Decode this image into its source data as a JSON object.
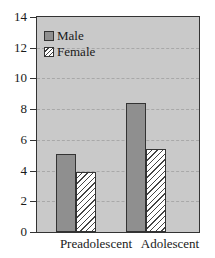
{
  "chart_data": {
    "type": "bar",
    "title": "",
    "xlabel": "",
    "ylabel": "",
    "categories": [
      "Preadolescent",
      "Adolescent"
    ],
    "series": [
      {
        "name": "Male",
        "values": [
          5.1,
          8.4
        ],
        "fill": "#8f8f8f",
        "pattern": "solid"
      },
      {
        "name": "Female",
        "values": [
          3.9,
          5.4
        ],
        "fill": "#ffffff",
        "pattern": "diagonal-hatch"
      }
    ],
    "ylim": [
      0,
      14
    ],
    "yticks": [
      "0",
      "2",
      "4",
      "6",
      "8",
      "10",
      "12",
      "14"
    ],
    "grid": true,
    "legend_position": "upper-left-inside",
    "background": "#c9c9c9"
  },
  "legend": {
    "male_label": "Male",
    "female_label": "Female"
  }
}
